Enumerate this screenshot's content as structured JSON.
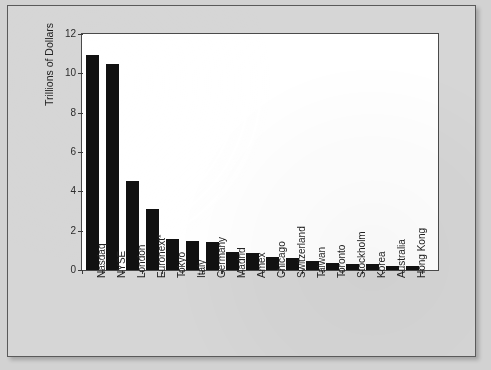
{
  "chart_data": {
    "type": "bar",
    "title": "",
    "subtitle": "",
    "xlabel": "",
    "ylabel": "Trillions of Dollars",
    "ylim": [
      0,
      12
    ],
    "yticks": [
      0,
      2,
      4,
      6,
      8,
      10,
      12
    ],
    "ytick_labels": [
      "0",
      "2",
      "4",
      "6",
      "8",
      "10",
      "12"
    ],
    "grid": false,
    "legend": false,
    "legend_position": "none",
    "bar_color": "#111111",
    "plot_background": "#ffffff",
    "page_background": "#d6d6d6",
    "categories": [
      "Nasdaq",
      "NYSE",
      "London",
      "Euronext*",
      "Tokyo",
      "Italy",
      "Germany",
      "Madrid",
      "Amex",
      "Chicago",
      "Switzerland",
      "Taiwan",
      "Toronto",
      "Stockholm",
      "Korea",
      "Australia",
      "Hong Kong"
    ],
    "values": [
      10.95,
      10.45,
      4.55,
      3.1,
      1.6,
      1.5,
      1.4,
      0.9,
      0.85,
      0.65,
      0.6,
      0.45,
      0.35,
      0.3,
      0.3,
      0.2,
      0.2
    ]
  }
}
